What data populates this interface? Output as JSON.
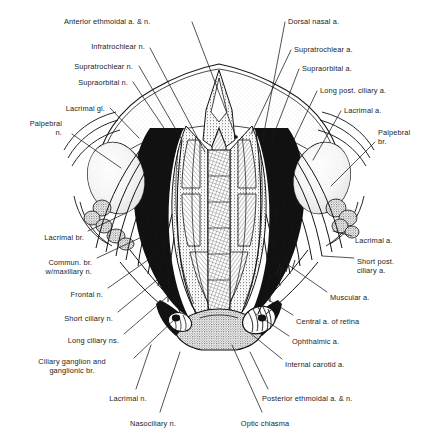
{
  "plate": {
    "title": "Orbital contents, superior view",
    "description": "Anatomical line engraving of the orbits viewed from above, showing the ophthalmic artery and its branches together with the ophthalmic division of the trigeminal nerve, the ciliary ganglion, the optic nerves and the optic chiasma.",
    "width": 438,
    "height": 439,
    "background": "#ffffff",
    "ink": "#1a1a1a"
  },
  "labels": [
    {
      "id": "anterior-ethmoidal",
      "text": "Anterior ethmoidal a. & n.",
      "align": "left",
      "x": 64,
      "y": 17,
      "side": "top-left"
    },
    {
      "id": "infratrochlear",
      "text": "Infratrochlear n.",
      "align": "right",
      "x": 145,
      "y": 42,
      "side": "top-left"
    },
    {
      "id": "supratrochlear-n",
      "text": "Supratrochlear n.",
      "align": "right",
      "x": 133,
      "y": 62,
      "side": "top-left"
    },
    {
      "id": "supraorbital-n",
      "text": "Supraorbital n.",
      "align": "right",
      "x": 128,
      "y": 78,
      "side": "top-left"
    },
    {
      "id": "lacrimal-gl",
      "text": "Lacrimal gl.",
      "align": "right",
      "x": 105,
      "y": 104,
      "side": "left"
    },
    {
      "id": "palpebral-n",
      "text": "Palpebral\nn.",
      "align": "right",
      "x": 62,
      "y": 119,
      "side": "left"
    },
    {
      "id": "dorsal-nasal",
      "text": "Dorsal nasal a.",
      "align": "left",
      "x": 288,
      "y": 17,
      "side": "top-right"
    },
    {
      "id": "supratrochlear-a",
      "text": "Supratrochlear a.",
      "align": "left",
      "x": 294,
      "y": 45,
      "side": "top-right"
    },
    {
      "id": "supraorbital-a",
      "text": "Supraorbital a.",
      "align": "left",
      "x": 302,
      "y": 64,
      "side": "top-right"
    },
    {
      "id": "long-post-ciliary",
      "text": "Long post. ciliary a.",
      "align": "left",
      "x": 320,
      "y": 86,
      "side": "top-right"
    },
    {
      "id": "lacrimal-a-top",
      "text": "Lacrimal a.",
      "align": "left",
      "x": 344,
      "y": 106,
      "side": "right"
    },
    {
      "id": "palpebral-br",
      "text": "Palpebral\nbr.",
      "align": "left",
      "x": 378,
      "y": 128,
      "side": "right"
    },
    {
      "id": "lacrimal-br",
      "text": "Lacrimal br.",
      "align": "right",
      "x": 84,
      "y": 233,
      "side": "left"
    },
    {
      "id": "commun-br",
      "text": "Commun. br.\nw/maxillary n.",
      "align": "right",
      "x": 92,
      "y": 258,
      "side": "left"
    },
    {
      "id": "frontal-n",
      "text": "Frontal n.",
      "align": "right",
      "x": 103,
      "y": 290,
      "side": "left"
    },
    {
      "id": "short-ciliary-n",
      "text": "Short ciliary n.",
      "align": "right",
      "x": 113,
      "y": 314,
      "side": "left"
    },
    {
      "id": "long-ciliary-ns",
      "text": "Long ciliary ns.",
      "align": "right",
      "x": 119,
      "y": 336,
      "side": "left"
    },
    {
      "id": "ciliary-ganglion",
      "text": "Ciliary ganglion and\nganglionic br.",
      "align": "center",
      "x": 72,
      "y": 357,
      "side": "left"
    },
    {
      "id": "lacrimal-a-right",
      "text": "Lacrimal a.",
      "align": "left",
      "x": 355,
      "y": 236,
      "side": "right"
    },
    {
      "id": "short-post-ciliary",
      "text": "Short post.\nciliary a.",
      "align": "left",
      "x": 357,
      "y": 257,
      "side": "right"
    },
    {
      "id": "muscular-a",
      "text": "Muscular a.",
      "align": "left",
      "x": 330,
      "y": 293,
      "side": "right"
    },
    {
      "id": "central-a-retina",
      "text": "Central a. of retina",
      "align": "left",
      "x": 296,
      "y": 317,
      "side": "right"
    },
    {
      "id": "ophthalmic-a",
      "text": "Ophthalmic a.",
      "align": "left",
      "x": 292,
      "y": 337,
      "side": "right"
    },
    {
      "id": "internal-carotid-a",
      "text": "Internal carotid a.",
      "align": "left",
      "x": 285,
      "y": 360,
      "side": "right"
    },
    {
      "id": "lacrimal-n",
      "text": "Lacrimal n.",
      "align": "center",
      "x": 128,
      "y": 394,
      "side": "bottom"
    },
    {
      "id": "nasociliary-n",
      "text": "Nasociliary n.",
      "align": "center",
      "x": 153,
      "y": 419,
      "side": "bottom"
    },
    {
      "id": "optic-chiasma",
      "text": "Optic chiasma",
      "align": "center",
      "x": 265,
      "y": 419,
      "side": "bottom"
    },
    {
      "id": "posterior-ethmoidal",
      "text": "Posterior ethmoidal a. & n.",
      "align": "left",
      "x": 262,
      "y": 394,
      "side": "bottom"
    }
  ],
  "leaders": [
    {
      "id": "leader-anterior-ethmoidal",
      "from": [
        192,
        22
      ],
      "to": [
        236,
        137
      ]
    },
    {
      "id": "leader-infratrochlear",
      "from": [
        150,
        48
      ],
      "to": [
        205,
        152
      ]
    },
    {
      "id": "leader-supratrochlear-n",
      "from": [
        139,
        66
      ],
      "to": [
        182,
        140
      ]
    },
    {
      "id": "leader-supraorbital-n",
      "from": [
        133,
        82
      ],
      "to": [
        166,
        131
      ]
    },
    {
      "id": "leader-lacrimal-gl",
      "from": [
        110,
        108
      ],
      "to": [
        139,
        138
      ]
    },
    {
      "id": "leader-palpebral-n",
      "from": [
        72,
        134
      ],
      "to": [
        121,
        168
      ]
    },
    {
      "id": "leader-dorsal-nasal",
      "from": [
        285,
        22
      ],
      "to": [
        262,
        143
      ]
    },
    {
      "id": "leader-supratrochlear-a",
      "from": [
        291,
        50
      ],
      "to": [
        251,
        134
      ]
    },
    {
      "id": "leader-supraorbital-a",
      "from": [
        299,
        69
      ],
      "to": [
        272,
        139
      ]
    },
    {
      "id": "leader-long-post-ciliary",
      "from": [
        317,
        91
      ],
      "to": [
        290,
        148
      ]
    },
    {
      "id": "leader-lacrimal-a-top",
      "from": [
        341,
        111
      ],
      "to": [
        313,
        160
      ]
    },
    {
      "id": "leader-palpebral-br",
      "from": [
        375,
        142
      ],
      "to": [
        331,
        186
      ]
    },
    {
      "id": "leader-lacrimal-br",
      "from": [
        88,
        231
      ],
      "to": [
        126,
        213
      ]
    },
    {
      "id": "leader-commun-br",
      "from": [
        97,
        258
      ],
      "to": [
        144,
        236
      ]
    },
    {
      "id": "leader-frontal-n",
      "from": [
        108,
        288
      ],
      "to": [
        158,
        253
      ]
    },
    {
      "id": "leader-short-ciliary-n",
      "from": [
        118,
        312
      ],
      "to": [
        163,
        275
      ]
    },
    {
      "id": "leader-long-ciliary-ns",
      "from": [
        124,
        334
      ],
      "to": [
        168,
        296
      ]
    },
    {
      "id": "leader-ciliary-ganglion",
      "from": [
        134,
        358
      ],
      "to": [
        176,
        318
      ]
    },
    {
      "id": "leader-lacrimal-a-right",
      "from": [
        352,
        236
      ],
      "to": [
        333,
        231
      ]
    },
    {
      "id": "leader-short-post-ciliary",
      "from": [
        354,
        258
      ],
      "to": [
        322,
        256
      ]
    },
    {
      "id": "leader-muscular-a",
      "from": [
        327,
        292
      ],
      "to": [
        284,
        262
      ]
    },
    {
      "id": "leader-central-a-retina",
      "from": [
        293,
        315
      ],
      "to": [
        262,
        296
      ]
    },
    {
      "id": "leader-ophthalmic-a",
      "from": [
        289,
        336
      ],
      "to": [
        256,
        314
      ]
    },
    {
      "id": "leader-internal-carotid-a",
      "from": [
        282,
        359
      ],
      "to": [
        250,
        333
      ]
    },
    {
      "id": "leader-lacrimal-n",
      "from": [
        136,
        389
      ],
      "to": [
        151,
        345
      ]
    },
    {
      "id": "leader-nasociliary-n",
      "from": [
        160,
        412
      ],
      "to": [
        180,
        352
      ]
    },
    {
      "id": "leader-optic-chiasma",
      "from": [
        262,
        412
      ],
      "to": [
        232,
        345
      ]
    },
    {
      "id": "leader-posterior-ethmoidal",
      "from": [
        268,
        389
      ],
      "to": [
        250,
        352
      ]
    }
  ]
}
